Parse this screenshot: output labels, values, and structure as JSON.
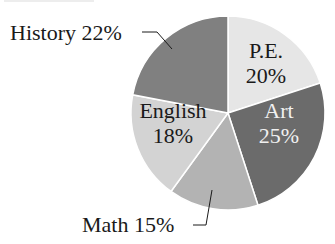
{
  "chart_data": {
    "type": "pie",
    "title": "",
    "start": "top",
    "direction": "clockwise",
    "slices": [
      {
        "label": "P.E.",
        "value": 20,
        "display": "20%",
        "color": "#e6e6e6",
        "text_color": "#1a1a1a",
        "label_mode": "inside"
      },
      {
        "label": "Art",
        "value": 25,
        "display": "25%",
        "color": "#6b6b6b",
        "text_color": "#f0f0f0",
        "label_mode": "inside"
      },
      {
        "label": "Math",
        "value": 15,
        "display": "15%",
        "color": "#b3b3b3",
        "text_color": "#1a1a1a",
        "label_mode": "outside-bottom"
      },
      {
        "label": "English",
        "value": 18,
        "display": "18%",
        "color": "#d3d3d3",
        "text_color": "#1a1a1a",
        "label_mode": "inside"
      },
      {
        "label": "History",
        "value": 22,
        "display": "22%",
        "color": "#808080",
        "text_color": "#1a1a1a",
        "label_mode": "outside-top"
      }
    ],
    "outside_labels": {
      "history": "History 22%",
      "math": "Math 15%"
    }
  }
}
